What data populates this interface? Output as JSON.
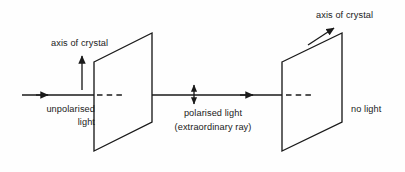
{
  "figure": {
    "kind": "optics-diagram",
    "background_color": "#fefefe",
    "stroke_color": "#1a1a1a"
  },
  "labels": {
    "axis_left": "axis of crystal",
    "axis_right": "axis of crystal",
    "incoming_line1": "unpolarised",
    "incoming_line2": "light",
    "middle_line1": "polarised light",
    "middle_line2": "(extraordinary ray)",
    "outgoing": "no light"
  },
  "diagram_data": {
    "type": "schematic",
    "optical_axis_y": 95,
    "ray_start_x": 22,
    "ray_end_x": 342,
    "crystals": [
      {
        "name": "crystal-1",
        "left_x": 94,
        "right_x": 152,
        "top_left_y": 62,
        "top_right_y": 33,
        "bottom_left_y": 151,
        "bottom_right_y": 122,
        "axis_marker": "vertical-arrow",
        "axis_arrow": {
          "x": 82,
          "y_tip": 55,
          "y_tail": 90
        }
      },
      {
        "name": "crystal-2",
        "left_x": 282,
        "right_x": 342,
        "top_left_y": 62,
        "top_right_y": 33,
        "bottom_left_y": 151,
        "bottom_right_y": 122,
        "axis_marker": "diagonal-arrow",
        "axis_arrow": {
          "x_tail": 310,
          "y_tail": 44,
          "x_tip": 333,
          "y_tip": 29
        }
      }
    ],
    "ray_segments": [
      {
        "name": "incident-ray",
        "style": "solid",
        "x1": 22,
        "x2": 94,
        "arrowhead_x": 47
      },
      {
        "name": "inside-crystal-1",
        "style": "dashed",
        "x1": 98,
        "x2": 123
      },
      {
        "name": "between-crystals",
        "style": "solid",
        "x1": 152,
        "x2": 282,
        "arrowhead_x": 252
      },
      {
        "name": "inside-crystal-2",
        "style": "dashed",
        "x1": 287,
        "x2": 313
      }
    ],
    "polarisation_marker": {
      "name": "vertical-double-arrow",
      "x": 194,
      "y_top": 84,
      "y_bottom": 105
    }
  }
}
